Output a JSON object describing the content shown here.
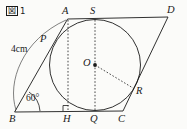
{
  "figure": {
    "caption_boxed": "図",
    "caption_number": "1",
    "side_length_label": "4cm",
    "angle_label": "60°",
    "stroke_color": "#1a1a1a",
    "background_color": "#fbfbf9"
  },
  "points": {
    "A": {
      "label": "A",
      "x": 68,
      "y": 19
    },
    "B": {
      "label": "B",
      "x": 15,
      "y": 112
    },
    "C": {
      "label": "C",
      "x": 123,
      "y": 111
    },
    "D": {
      "label": "D",
      "x": 168,
      "y": 17
    },
    "P": {
      "label": "P",
      "x": 52,
      "y": 44
    },
    "Q": {
      "label": "Q",
      "x": 95,
      "y": 111
    },
    "R": {
      "label": "R",
      "x": 133,
      "y": 88
    },
    "S": {
      "label": "S",
      "x": 95,
      "y": 20
    },
    "H": {
      "label": "H",
      "x": 68,
      "y": 111
    },
    "O": {
      "label": "O",
      "x": 95,
      "y": 65
    }
  },
  "circle": {
    "center_x": 95,
    "center_y": 65,
    "radius": 45.5
  },
  "annotations": {
    "right_angle_at": "H",
    "angle_vertex": "B",
    "arc_measure_from": "B",
    "arc_measure_to": "A"
  },
  "label_positions": {
    "A": {
      "x": 62,
      "y": 6
    },
    "S": {
      "x": 90,
      "y": 6
    },
    "D": {
      "x": 167,
      "y": 5
    },
    "P": {
      "x": 40,
      "y": 34
    },
    "O": {
      "x": 84,
      "y": 58
    },
    "R": {
      "x": 136,
      "y": 86
    },
    "B": {
      "x": 9,
      "y": 114
    },
    "H": {
      "x": 63,
      "y": 114
    },
    "Q": {
      "x": 90,
      "y": 114
    },
    "C": {
      "x": 119,
      "y": 114
    },
    "four_cm": {
      "x": 11,
      "y": 46
    },
    "angle": {
      "x": 26,
      "y": 95
    }
  }
}
